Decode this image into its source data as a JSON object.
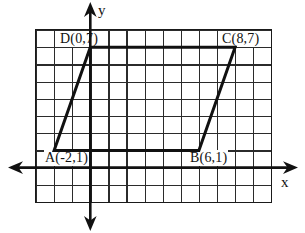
{
  "figure": {
    "type": "coordinate-geometry-diagram",
    "shape": "parallelogram",
    "axis_labels": {
      "x": "x",
      "y": "y"
    },
    "labels": {
      "A": "A(-2,1)",
      "B": "B(6,1)",
      "C": "C(8,7)",
      "D": "D(0,7)"
    },
    "vertices": [
      {
        "name": "A",
        "x": -2,
        "y": 1
      },
      {
        "name": "B",
        "x": 6,
        "y": 1
      },
      {
        "name": "C",
        "x": 8,
        "y": 7
      },
      {
        "name": "D",
        "x": 0,
        "y": 7
      }
    ],
    "grid": {
      "columns": 13,
      "rows": 10,
      "x_range": [
        -3,
        10
      ],
      "y_range": [
        -2,
        8
      ]
    },
    "polygon_points_px": "54.1,150.4 198.9,150.4 235.1,47.2 90.3,47.2",
    "colors": {
      "line": "#111111",
      "grid_line": "#2b2b2b",
      "background": "#ffffff"
    }
  }
}
